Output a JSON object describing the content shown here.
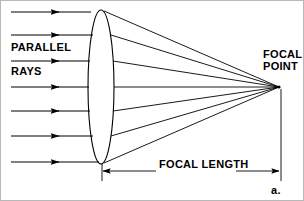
{
  "figure": {
    "part_label": "a.",
    "background_color": "#ffffff",
    "stroke_color": "#000000",
    "labels": {
      "parallel": "PARALLEL",
      "rays": "RAYS",
      "focal_point_line1": "FOCAL",
      "focal_point_line2": "POINT",
      "focal_length": "FOCAL LENGTH"
    },
    "lens": {
      "name": "convex-lens",
      "center_x": 100,
      "center_y": 86,
      "radius_x": 13,
      "radius_y": 77
    },
    "focal_point": {
      "x": 278,
      "y": 86
    },
    "incoming_rays": {
      "count": 7,
      "start_x": 10,
      "arrow_x": 58,
      "y_positions": [
        11,
        34,
        60,
        86,
        110,
        135,
        161
      ]
    },
    "refracted_rays": {
      "count": 7,
      "lens_exit_x_positions": [
        102,
        110,
        112,
        113,
        112,
        110,
        102
      ],
      "y_positions": [
        9,
        34,
        60,
        86,
        110,
        135,
        162
      ]
    },
    "dimension_line": {
      "y": 170,
      "x_start": 101,
      "x_end": 279,
      "extension_left_x": 101,
      "extension_right_x": 280
    }
  }
}
